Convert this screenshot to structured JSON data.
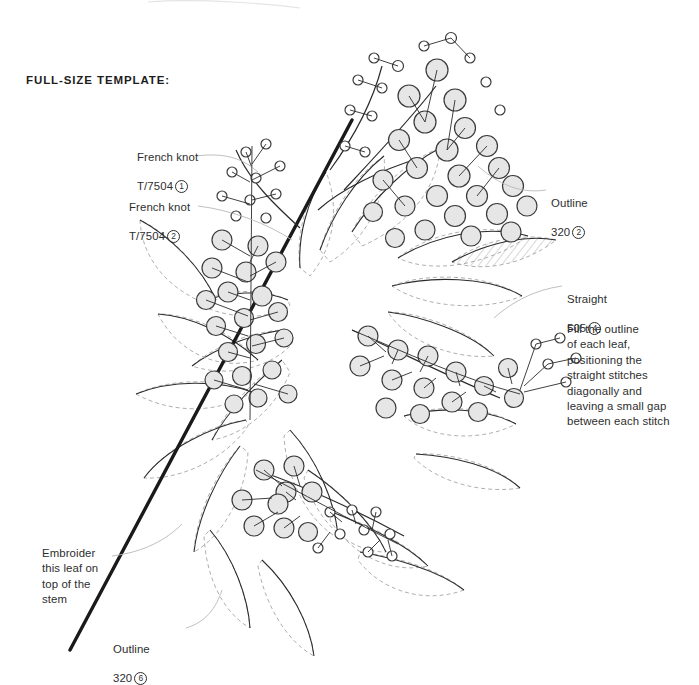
{
  "document": {
    "title": "FULL-SIZE TEMPLATE:",
    "background_color": "#ffffff",
    "text_color": "#2e2e2e"
  },
  "palette": {
    "stem_dark": "#1a1a1a",
    "line_dark": "#2b2b2b",
    "dashed_gray": "#9a9a9a",
    "berry_fill": "#e6e6e6",
    "berry_stroke": "#3a3a3a",
    "leader_gray": "#b8b8b8",
    "hatch_gray": "#9a9a9a"
  },
  "callouts": [
    {
      "id": "french-knot-1",
      "line1": "French knot",
      "stitch": "French knot",
      "thread": "T/7504",
      "strands": "1",
      "strands_glyph": "①",
      "x": 137,
      "y": 136
    },
    {
      "id": "french-knot-2",
      "line1": "French knot",
      "stitch": "French knot",
      "thread": "T/7504",
      "strands": "2",
      "strands_glyph": "②",
      "x": 129,
      "y": 186
    },
    {
      "id": "outline-320-2",
      "stitch": "Outline",
      "thread": "320",
      "strands": "2",
      "strands_glyph": "②",
      "x": 551,
      "y": 182
    },
    {
      "id": "straight-505-4",
      "stitch": "Straight",
      "thread": "505",
      "strands": "4",
      "strands_glyph": "④",
      "x": 567,
      "y": 278
    },
    {
      "id": "outline-320-6",
      "stitch": "Outline",
      "thread": "320",
      "strands": "6",
      "strands_glyph": "⑥",
      "x": 113,
      "y": 628
    }
  ],
  "notes": [
    {
      "id": "fill-note",
      "text": "Fill the outline\nof each leaf,\npositioning the\nstraight stitches\ndiagonally and\nleaving a small gap\nbetween each stitch",
      "x": 567,
      "y": 322
    },
    {
      "id": "stem-note",
      "text": "Embroider\nthis leaf on\ntop of the\nstem",
      "x": 42,
      "y": 546
    }
  ],
  "artwork": {
    "subject": "berry-branch-embroidery-template",
    "main_stem": {
      "x1": 70,
      "y1": 650,
      "x2": 352,
      "y2": 120,
      "width": 3.4
    },
    "leader_lines": [
      "M196,156 C228,152 244,160 258,170",
      "M198,206 C232,208 268,222 290,238",
      "M548,190 C520,192 498,182 478,168",
      "M562,286 C536,288 512,300 492,316",
      "M186,628 C206,622 216,608 222,592",
      "M112,556 C142,552 164,540 180,526"
    ]
  }
}
